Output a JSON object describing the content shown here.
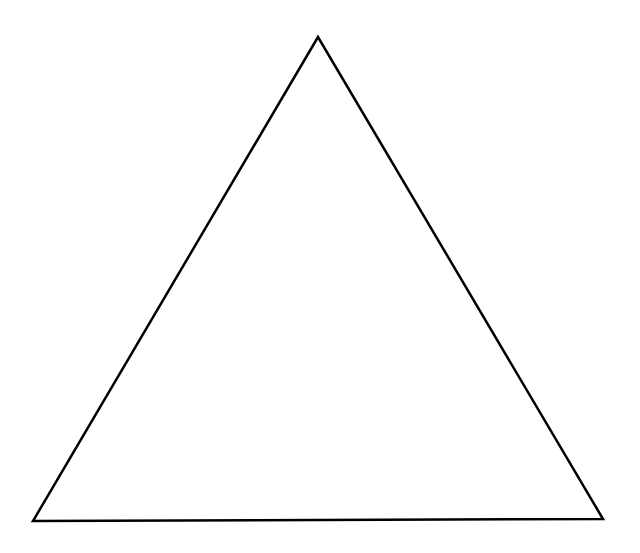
{
  "diagram": {
    "shape": "triangle",
    "background": "#ffffff",
    "stroke_color": "#000000",
    "fill_color": "#ffffff",
    "stroke_width": 2.5,
    "vertices": {
      "apex": [
        318,
        37
      ],
      "bottom_left": [
        33,
        521
      ],
      "bottom_right": [
        603,
        519
      ]
    }
  }
}
